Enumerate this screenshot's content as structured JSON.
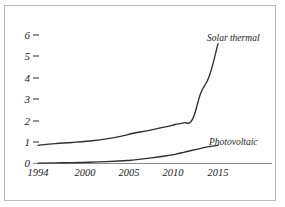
{
  "chart_data": {
    "type": "line",
    "title": "",
    "subtitle": "",
    "xlabel": "",
    "ylabel": "",
    "xlim": [
      1994,
      2016
    ],
    "ylim": [
      0,
      6.4
    ],
    "grid": false,
    "legend_position": "inline-right",
    "yticks": [
      "0",
      "1",
      "2",
      "3",
      "4",
      "5",
      "6"
    ],
    "ytick_values": [
      0,
      1,
      2,
      3,
      4,
      5,
      6
    ],
    "xticks": [
      "1994",
      "2000",
      "2005",
      "2010",
      "2015"
    ],
    "xtick_values": [
      1994,
      2000,
      2005,
      2010,
      2015
    ],
    "series": [
      {
        "name": "Solar thermal",
        "label": "Solar thermal",
        "color": "#2f2f2f",
        "x": [
          1994,
          1996,
          1998,
          2000,
          2002,
          2004,
          2005,
          2007,
          2009,
          2010,
          2011,
          2012,
          2013,
          2014,
          2015
        ],
        "values": [
          0.85,
          0.93,
          0.98,
          1.05,
          1.15,
          1.3,
          1.4,
          1.55,
          1.72,
          1.82,
          1.9,
          2.05,
          3.3,
          4.1,
          5.6
        ]
      },
      {
        "name": "Photovoltaic",
        "label": "Photovoltaic",
        "color": "#2f2f2f",
        "x": [
          1994,
          1996,
          1998,
          2000,
          2002,
          2004,
          2005,
          2007,
          2009,
          2010,
          2011,
          2012,
          2013,
          2014,
          2015
        ],
        "values": [
          0.02,
          0.03,
          0.04,
          0.06,
          0.09,
          0.13,
          0.16,
          0.25,
          0.36,
          0.43,
          0.52,
          0.62,
          0.71,
          0.79,
          0.85
        ]
      }
    ],
    "baseline_color": "#8d8d8d",
    "frame_color": "#b9b9b9",
    "background": "#ffffff"
  }
}
